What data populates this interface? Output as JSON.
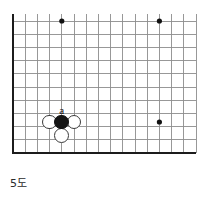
{
  "figure": {
    "caption": "5도",
    "kind": "go-board-diagram",
    "board": {
      "line_color": "#8d8d8d",
      "border_color": "#1c1c1c",
      "background_color": "#ffffff",
      "columns": 15,
      "rows": 11,
      "origin_x": 13,
      "origin_y": 21,
      "col_spacing": 12.2,
      "row_spacing": 13.2,
      "edges": {
        "left": "thick",
        "bottom": "thick",
        "top": "cut-off",
        "right": "cut-off"
      }
    },
    "star_points": [
      {
        "name": "star-point-upper-left",
        "col": 4,
        "row": 0
      },
      {
        "name": "star-point-upper-right",
        "col": 12,
        "row": 0
      },
      {
        "name": "star-point-center-right",
        "col": 12,
        "row": 7.65
      }
    ],
    "stones": [
      {
        "name": "black-stone-a",
        "color": "black",
        "col": 4,
        "row": 7.65,
        "label": "a"
      },
      {
        "name": "white-stone-left",
        "color": "white",
        "col": 3,
        "row": 7.65,
        "label": ""
      },
      {
        "name": "white-stone-right",
        "color": "white",
        "col": 5,
        "row": 7.65,
        "label": ""
      },
      {
        "name": "white-stone-below",
        "color": "white",
        "col": 4,
        "row": 8.65,
        "label": ""
      }
    ],
    "labels": [
      {
        "name": "stone-label-a",
        "text": "a",
        "col": 4,
        "row": 6.8
      }
    ]
  }
}
